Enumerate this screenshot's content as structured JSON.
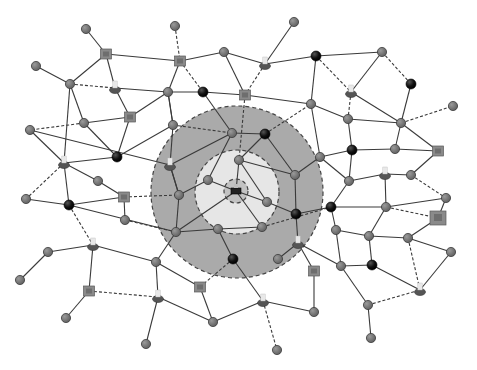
{
  "diagram": {
    "type": "network-topology",
    "colors": {
      "background": "#ffffff",
      "zone_outer": "#aaaaaa",
      "zone_inner": "#e6e6e6",
      "zone_core": "#c2c2c2",
      "edge": "#3a3a3a",
      "node_grey": "#7d7d7d",
      "node_black": "#111111",
      "node_square": "#8a8a8a",
      "node_user_base": "#555555",
      "node_user_top": "#e8e8e8"
    },
    "zones": [
      {
        "name": "outer-zone",
        "cx": 237,
        "cy": 192,
        "r": 86
      },
      {
        "name": "inner-zone",
        "cx": 237,
        "cy": 192,
        "r": 42
      },
      {
        "name": "core-zone",
        "cx": 236,
        "cy": 191,
        "r": 12
      }
    ],
    "nodes": [
      {
        "id": "n1",
        "x": 36,
        "y": 66,
        "type": "grey"
      },
      {
        "id": "n2",
        "x": 86,
        "y": 29,
        "type": "grey"
      },
      {
        "id": "n3",
        "x": 106,
        "y": 54,
        "type": "square"
      },
      {
        "id": "n4",
        "x": 70,
        "y": 84,
        "type": "grey"
      },
      {
        "id": "n5",
        "x": 115,
        "y": 88,
        "type": "user"
      },
      {
        "id": "n6",
        "x": 130,
        "y": 117,
        "type": "square"
      },
      {
        "id": "n7",
        "x": 84,
        "y": 123,
        "type": "grey"
      },
      {
        "id": "n8",
        "x": 30,
        "y": 130,
        "type": "grey"
      },
      {
        "id": "n9",
        "x": 64,
        "y": 163,
        "type": "user"
      },
      {
        "id": "n10",
        "x": 117,
        "y": 157,
        "type": "black"
      },
      {
        "id": "n11",
        "x": 98,
        "y": 181,
        "type": "grey"
      },
      {
        "id": "n12",
        "x": 124,
        "y": 197,
        "type": "square"
      },
      {
        "id": "n13",
        "x": 26,
        "y": 199,
        "type": "grey"
      },
      {
        "id": "n14",
        "x": 69,
        "y": 205,
        "type": "black"
      },
      {
        "id": "n15",
        "x": 125,
        "y": 220,
        "type": "grey"
      },
      {
        "id": "n16",
        "x": 48,
        "y": 252,
        "type": "grey"
      },
      {
        "id": "n17",
        "x": 93,
        "y": 245,
        "type": "user"
      },
      {
        "id": "n18",
        "x": 20,
        "y": 280,
        "type": "grey"
      },
      {
        "id": "n19",
        "x": 89,
        "y": 291,
        "type": "square"
      },
      {
        "id": "n20",
        "x": 66,
        "y": 318,
        "type": "grey"
      },
      {
        "id": "n21",
        "x": 175,
        "y": 26,
        "type": "grey"
      },
      {
        "id": "n22",
        "x": 180,
        "y": 61,
        "type": "square"
      },
      {
        "id": "n23",
        "x": 224,
        "y": 52,
        "type": "grey"
      },
      {
        "id": "n24",
        "x": 294,
        "y": 22,
        "type": "grey"
      },
      {
        "id": "n25",
        "x": 265,
        "y": 64,
        "type": "user"
      },
      {
        "id": "n26",
        "x": 168,
        "y": 92,
        "type": "grey"
      },
      {
        "id": "n27",
        "x": 203,
        "y": 92,
        "type": "black"
      },
      {
        "id": "n28",
        "x": 245,
        "y": 95,
        "type": "square"
      },
      {
        "id": "n29",
        "x": 173,
        "y": 125,
        "type": "grey"
      },
      {
        "id": "n30",
        "x": 232,
        "y": 133,
        "type": "grey"
      },
      {
        "id": "n31",
        "x": 265,
        "y": 134,
        "type": "black"
      },
      {
        "id": "n32",
        "x": 170,
        "y": 165,
        "type": "user"
      },
      {
        "id": "n33",
        "x": 239,
        "y": 160,
        "type": "grey"
      },
      {
        "id": "n34",
        "x": 208,
        "y": 180,
        "type": "grey"
      },
      {
        "id": "n35",
        "x": 236,
        "y": 191,
        "type": "core"
      },
      {
        "id": "n36",
        "x": 179,
        "y": 195,
        "type": "grey"
      },
      {
        "id": "n37",
        "x": 267,
        "y": 202,
        "type": "grey"
      },
      {
        "id": "n38",
        "x": 295,
        "y": 175,
        "type": "grey"
      },
      {
        "id": "n39",
        "x": 296,
        "y": 214,
        "type": "black"
      },
      {
        "id": "n40",
        "x": 176,
        "y": 232,
        "type": "grey"
      },
      {
        "id": "n41",
        "x": 218,
        "y": 229,
        "type": "grey"
      },
      {
        "id": "n42",
        "x": 262,
        "y": 227,
        "type": "grey"
      },
      {
        "id": "n43",
        "x": 156,
        "y": 262,
        "type": "grey"
      },
      {
        "id": "n44",
        "x": 233,
        "y": 259,
        "type": "black"
      },
      {
        "id": "n45",
        "x": 298,
        "y": 243,
        "type": "user"
      },
      {
        "id": "n46",
        "x": 278,
        "y": 259,
        "type": "grey"
      },
      {
        "id": "n47",
        "x": 200,
        "y": 287,
        "type": "square"
      },
      {
        "id": "n48",
        "x": 158,
        "y": 297,
        "type": "user"
      },
      {
        "id": "n49",
        "x": 213,
        "y": 322,
        "type": "grey"
      },
      {
        "id": "n50",
        "x": 146,
        "y": 344,
        "type": "grey"
      },
      {
        "id": "n51",
        "x": 263,
        "y": 301,
        "type": "user"
      },
      {
        "id": "n52",
        "x": 277,
        "y": 350,
        "type": "grey"
      },
      {
        "id": "n53",
        "x": 314,
        "y": 271,
        "type": "square"
      },
      {
        "id": "n54",
        "x": 314,
        "y": 312,
        "type": "grey"
      },
      {
        "id": "n55",
        "x": 316,
        "y": 56,
        "type": "black"
      },
      {
        "id": "n56",
        "x": 311,
        "y": 104,
        "type": "grey"
      },
      {
        "id": "n57",
        "x": 382,
        "y": 52,
        "type": "grey"
      },
      {
        "id": "n58",
        "x": 351,
        "y": 92,
        "type": "user"
      },
      {
        "id": "n59",
        "x": 411,
        "y": 84,
        "type": "black"
      },
      {
        "id": "n60",
        "x": 348,
        "y": 119,
        "type": "grey"
      },
      {
        "id": "n61",
        "x": 401,
        "y": 123,
        "type": "grey"
      },
      {
        "id": "n62",
        "x": 453,
        "y": 106,
        "type": "grey"
      },
      {
        "id": "n63",
        "x": 320,
        "y": 157,
        "type": "grey"
      },
      {
        "id": "n64",
        "x": 352,
        "y": 150,
        "type": "black"
      },
      {
        "id": "n65",
        "x": 395,
        "y": 149,
        "type": "grey"
      },
      {
        "id": "n66",
        "x": 438,
        "y": 151,
        "type": "square"
      },
      {
        "id": "n67",
        "x": 349,
        "y": 181,
        "type": "grey"
      },
      {
        "id": "n68",
        "x": 385,
        "y": 174,
        "type": "user"
      },
      {
        "id": "n69",
        "x": 411,
        "y": 175,
        "type": "grey"
      },
      {
        "id": "n70",
        "x": 331,
        "y": 207,
        "type": "black"
      },
      {
        "id": "n71",
        "x": 386,
        "y": 207,
        "type": "grey"
      },
      {
        "id": "n72",
        "x": 446,
        "y": 198,
        "type": "grey"
      },
      {
        "id": "n73",
        "x": 438,
        "y": 218,
        "type": "square-large"
      },
      {
        "id": "n74",
        "x": 336,
        "y": 230,
        "type": "grey"
      },
      {
        "id": "n75",
        "x": 369,
        "y": 236,
        "type": "grey"
      },
      {
        "id": "n76",
        "x": 408,
        "y": 238,
        "type": "grey"
      },
      {
        "id": "n77",
        "x": 341,
        "y": 266,
        "type": "grey"
      },
      {
        "id": "n78",
        "x": 372,
        "y": 265,
        "type": "black"
      },
      {
        "id": "n79",
        "x": 451,
        "y": 252,
        "type": "grey"
      },
      {
        "id": "n80",
        "x": 368,
        "y": 305,
        "type": "grey"
      },
      {
        "id": "n81",
        "x": 420,
        "y": 290,
        "type": "user"
      },
      {
        "id": "n82",
        "x": 371,
        "y": 338,
        "type": "grey"
      }
    ],
    "edges": [
      [
        "n1",
        "n4",
        "s"
      ],
      [
        "n2",
        "n3",
        "s"
      ],
      [
        "n3",
        "n4",
        "s"
      ],
      [
        "n3",
        "n5",
        "s"
      ],
      [
        "n3",
        "n22",
        "s"
      ],
      [
        "n4",
        "n5",
        "d"
      ],
      [
        "n4",
        "n7",
        "s"
      ],
      [
        "n4",
        "n9",
        "s"
      ],
      [
        "n5",
        "n6",
        "s"
      ],
      [
        "n5",
        "n26",
        "s"
      ],
      [
        "n6",
        "n7",
        "s"
      ],
      [
        "n6",
        "n10",
        "s"
      ],
      [
        "n6",
        "n26",
        "s"
      ],
      [
        "n7",
        "n8",
        "d"
      ],
      [
        "n7",
        "n10",
        "s"
      ],
      [
        "n8",
        "n9",
        "s"
      ],
      [
        "n9",
        "n10",
        "s"
      ],
      [
        "n9",
        "n11",
        "s"
      ],
      [
        "n9",
        "n13",
        "d"
      ],
      [
        "n9",
        "n14",
        "s"
      ],
      [
        "n10",
        "n29",
        "s"
      ],
      [
        "n11",
        "n12",
        "s"
      ],
      [
        "n12",
        "n14",
        "s"
      ],
      [
        "n12",
        "n15",
        "s"
      ],
      [
        "n12",
        "n36",
        "d"
      ],
      [
        "n13",
        "n14",
        "s"
      ],
      [
        "n14",
        "n17",
        "d"
      ],
      [
        "n14",
        "n40",
        "s"
      ],
      [
        "n15",
        "n40",
        "d"
      ],
      [
        "n16",
        "n17",
        "s"
      ],
      [
        "n16",
        "n18",
        "s"
      ],
      [
        "n17",
        "n19",
        "s"
      ],
      [
        "n17",
        "n43",
        "s"
      ],
      [
        "n19",
        "n20",
        "s"
      ],
      [
        "n19",
        "n48",
        "d"
      ],
      [
        "n21",
        "n22",
        "d"
      ],
      [
        "n22",
        "n23",
        "s"
      ],
      [
        "n22",
        "n26",
        "s"
      ],
      [
        "n22",
        "n27",
        "d"
      ],
      [
        "n23",
        "n25",
        "s"
      ],
      [
        "n23",
        "n28",
        "s"
      ],
      [
        "n24",
        "n25",
        "s"
      ],
      [
        "n25",
        "n28",
        "d"
      ],
      [
        "n25",
        "n55",
        "s"
      ],
      [
        "n26",
        "n27",
        "s"
      ],
      [
        "n26",
        "n29",
        "s"
      ],
      [
        "n27",
        "n28",
        "s"
      ],
      [
        "n27",
        "n30",
        "s"
      ],
      [
        "n28",
        "n33",
        "d"
      ],
      [
        "n28",
        "n56",
        "s"
      ],
      [
        "n29",
        "n30",
        "d"
      ],
      [
        "n29",
        "n32",
        "s"
      ],
      [
        "n30",
        "n31",
        "s"
      ],
      [
        "n30",
        "n34",
        "s"
      ],
      [
        "n31",
        "n33",
        "s"
      ],
      [
        "n31",
        "n56",
        "d"
      ],
      [
        "n31",
        "n38",
        "s"
      ],
      [
        "n32",
        "n30",
        "s"
      ],
      [
        "n32",
        "n36",
        "s"
      ],
      [
        "n32",
        "n8",
        "s"
      ],
      [
        "n33",
        "n35",
        "s"
      ],
      [
        "n33",
        "n38",
        "s"
      ],
      [
        "n34",
        "n35",
        "s"
      ],
      [
        "n34",
        "n36",
        "s"
      ],
      [
        "n35",
        "n37",
        "s"
      ],
      [
        "n35",
        "n40",
        "s"
      ],
      [
        "n35",
        "n42",
        "s"
      ],
      [
        "n36",
        "n40",
        "s"
      ],
      [
        "n37",
        "n39",
        "s"
      ],
      [
        "n38",
        "n39",
        "s"
      ],
      [
        "n38",
        "n63",
        "s"
      ],
      [
        "n39",
        "n45",
        "s"
      ],
      [
        "n39",
        "n70",
        "s"
      ],
      [
        "n40",
        "n41",
        "s"
      ],
      [
        "n40",
        "n43",
        "s"
      ],
      [
        "n41",
        "n42",
        "s"
      ],
      [
        "n41",
        "n44",
        "s"
      ],
      [
        "n42",
        "n70",
        "d"
      ],
      [
        "n43",
        "n47",
        "s"
      ],
      [
        "n43",
        "n48",
        "s"
      ],
      [
        "n44",
        "n47",
        "d"
      ],
      [
        "n44",
        "n51",
        "s"
      ],
      [
        "n45",
        "n46",
        "s"
      ],
      [
        "n45",
        "n53",
        "s"
      ],
      [
        "n45",
        "n77",
        "s"
      ],
      [
        "n47",
        "n49",
        "s"
      ],
      [
        "n48",
        "n49",
        "s"
      ],
      [
        "n48",
        "n50",
        "s"
      ],
      [
        "n49",
        "n51",
        "s"
      ],
      [
        "n51",
        "n52",
        "d"
      ],
      [
        "n51",
        "n54",
        "s"
      ],
      [
        "n53",
        "n54",
        "s"
      ],
      [
        "n55",
        "n56",
        "s"
      ],
      [
        "n55",
        "n57",
        "s"
      ],
      [
        "n55",
        "n58",
        "d"
      ],
      [
        "n56",
        "n60",
        "s"
      ],
      [
        "n56",
        "n63",
        "s"
      ],
      [
        "n57",
        "n58",
        "s"
      ],
      [
        "n57",
        "n59",
        "d"
      ],
      [
        "n58",
        "n60",
        "d"
      ],
      [
        "n58",
        "n61",
        "s"
      ],
      [
        "n59",
        "n61",
        "s"
      ],
      [
        "n60",
        "n61",
        "s"
      ],
      [
        "n60",
        "n64",
        "s"
      ],
      [
        "n61",
        "n62",
        "d"
      ],
      [
        "n61",
        "n65",
        "s"
      ],
      [
        "n61",
        "n66",
        "s"
      ],
      [
        "n63",
        "n64",
        "s"
      ],
      [
        "n63",
        "n67",
        "s"
      ],
      [
        "n64",
        "n65",
        "s"
      ],
      [
        "n64",
        "n67",
        "s"
      ],
      [
        "n65",
        "n66",
        "s"
      ],
      [
        "n66",
        "n69",
        "s"
      ],
      [
        "n67",
        "n68",
        "s"
      ],
      [
        "n67",
        "n70",
        "s"
      ],
      [
        "n68",
        "n69",
        "s"
      ],
      [
        "n68",
        "n71",
        "s"
      ],
      [
        "n69",
        "n72",
        "d"
      ],
      [
        "n70",
        "n71",
        "s"
      ],
      [
        "n70",
        "n74",
        "s"
      ],
      [
        "n71",
        "n72",
        "s"
      ],
      [
        "n71",
        "n73",
        "d"
      ],
      [
        "n71",
        "n75",
        "s"
      ],
      [
        "n72",
        "n73",
        "s"
      ],
      [
        "n73",
        "n76",
        "s"
      ],
      [
        "n74",
        "n75",
        "s"
      ],
      [
        "n74",
        "n77",
        "s"
      ],
      [
        "n75",
        "n76",
        "s"
      ],
      [
        "n75",
        "n78",
        "s"
      ],
      [
        "n76",
        "n79",
        "s"
      ],
      [
        "n76",
        "n81",
        "d"
      ],
      [
        "n77",
        "n78",
        "s"
      ],
      [
        "n77",
        "n80",
        "s"
      ],
      [
        "n78",
        "n81",
        "s"
      ],
      [
        "n79",
        "n81",
        "s"
      ],
      [
        "n80",
        "n81",
        "d"
      ],
      [
        "n80",
        "n82",
        "s"
      ],
      [
        "n36",
        "n32",
        "s"
      ],
      [
        "n29",
        "n26",
        "s"
      ],
      [
        "n37",
        "n33",
        "s"
      ]
    ]
  }
}
